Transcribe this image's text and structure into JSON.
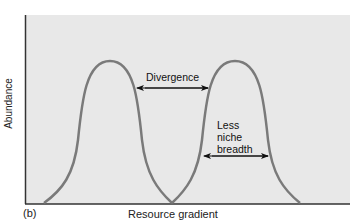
{
  "diagram": {
    "panel_label": "(b)",
    "x_axis_label": "Resource gradient",
    "y_axis_label": "Abundance",
    "annotations": {
      "divergence": "Divergence",
      "less_niche_breadth": [
        "Less",
        "niche",
        "breadth"
      ]
    },
    "curves": [
      {
        "name": "species-1",
        "start_x": 44,
        "peak_x": 110,
        "end_x": 172
      },
      {
        "name": "species-2",
        "start_x": 172,
        "peak_x": 235,
        "end_x": 300
      }
    ],
    "colors": {
      "background": "#e8e8e8",
      "curve": "#7a7a7a",
      "axis": "#333333",
      "arrow": "#111111"
    }
  }
}
